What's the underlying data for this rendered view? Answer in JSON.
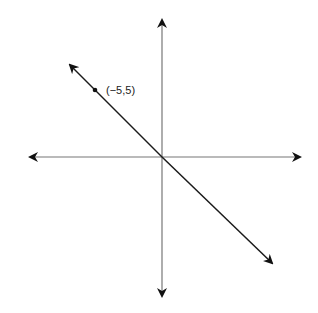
{
  "diagram": {
    "type": "coordinate-plane",
    "axes": {
      "x_axis": {
        "arrows": "both"
      },
      "y_axis": {
        "arrows": "both"
      }
    },
    "line": {
      "slope": -1,
      "passes_through_origin": true,
      "arrows": "both"
    },
    "points": [
      {
        "label": "(−5,5)",
        "x": -5,
        "y": 5
      }
    ],
    "colors": {
      "axis": "#666666",
      "line": "#1a1a1a",
      "background": "#ffffff"
    }
  }
}
